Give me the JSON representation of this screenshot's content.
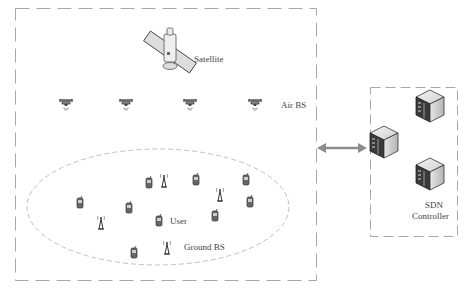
{
  "diagram": {
    "labels": {
      "satellite": "Satellite",
      "air_bs": "Air BS",
      "user": "User",
      "ground_bs": "Ground BS",
      "sdn_line1": "SDN",
      "sdn_line2": "Controller"
    },
    "colors": {
      "dash": "#a8a8a8",
      "arrow": "#8c8c8c",
      "text": "#444444"
    },
    "nodes": {
      "satellite": {
        "x": 170,
        "y": 52
      },
      "air_bs": [
        {
          "x": 66,
          "y": 104
        },
        {
          "x": 126,
          "y": 104
        },
        {
          "x": 190,
          "y": 104
        },
        {
          "x": 255,
          "y": 104
        }
      ],
      "users": [
        {
          "x": 80,
          "y": 203
        },
        {
          "x": 129,
          "y": 208
        },
        {
          "x": 149,
          "y": 183
        },
        {
          "x": 159,
          "y": 221
        },
        {
          "x": 196,
          "y": 180
        },
        {
          "x": 215,
          "y": 216
        },
        {
          "x": 246,
          "y": 180
        },
        {
          "x": 250,
          "y": 202
        },
        {
          "x": 134,
          "y": 253
        }
      ],
      "ground_bs": [
        {
          "x": 101,
          "y": 222
        },
        {
          "x": 164,
          "y": 180
        },
        {
          "x": 220,
          "y": 194
        },
        {
          "x": 167,
          "y": 247
        }
      ],
      "servers": [
        {
          "x": 384,
          "y": 148
        },
        {
          "x": 430,
          "y": 110
        },
        {
          "x": 430,
          "y": 178
        }
      ]
    }
  }
}
